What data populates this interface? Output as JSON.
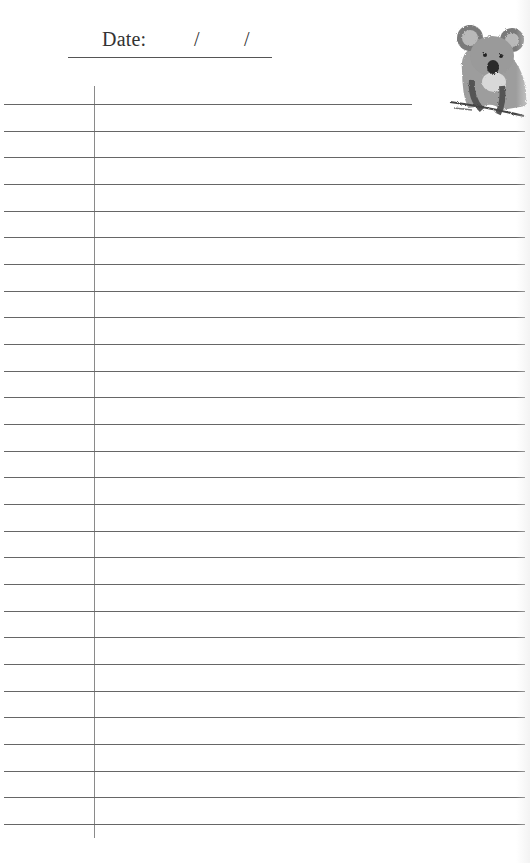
{
  "header": {
    "date_label": "Date:",
    "date_separator_1": "/",
    "date_separator_2": "/"
  },
  "illustration": {
    "subject": "koala-illustration"
  },
  "page": {
    "line_count": 28,
    "first_line_y": 104,
    "line_spacing": 26.67,
    "margin_x": 94,
    "line_color": "#666666",
    "margin_color": "#8a8a8a"
  }
}
